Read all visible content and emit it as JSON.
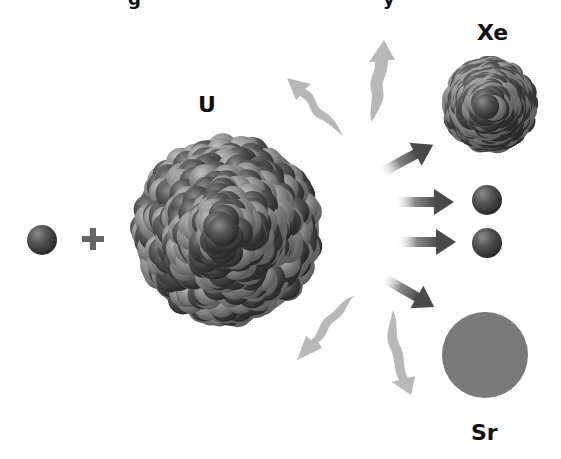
{
  "diagram": {
    "title_fragment_visible": "g … y",
    "labels": {
      "uranium": "U",
      "xenon": "Xe",
      "strontium": "Sr",
      "plus": "+"
    },
    "elements": [
      {
        "id": "incoming-neutron",
        "kind": "neutron",
        "label": ""
      },
      {
        "id": "plus-sign",
        "kind": "operator",
        "label": "+"
      },
      {
        "id": "uranium-nucleus",
        "kind": "nucleus",
        "label": "U"
      },
      {
        "id": "xenon-nucleus",
        "kind": "nucleus",
        "label": "Xe"
      },
      {
        "id": "released-neutron-1",
        "kind": "neutron",
        "label": ""
      },
      {
        "id": "released-neutron-2",
        "kind": "neutron",
        "label": ""
      },
      {
        "id": "strontium-nucleus",
        "kind": "nucleus",
        "label": "Sr"
      }
    ],
    "arrows": [
      {
        "id": "arrow-to-xe",
        "style": "straight",
        "direction": "up-right"
      },
      {
        "id": "arrow-to-neutron-1",
        "style": "straight",
        "direction": "right"
      },
      {
        "id": "arrow-to-neutron-2",
        "style": "straight",
        "direction": "right"
      },
      {
        "id": "arrow-to-sr",
        "style": "straight",
        "direction": "down-right"
      },
      {
        "id": "energy-wave-up-left",
        "style": "wavy",
        "direction": "up-left"
      },
      {
        "id": "energy-wave-up",
        "style": "wavy",
        "direction": "up"
      },
      {
        "id": "energy-wave-down-left",
        "style": "wavy",
        "direction": "down-left"
      },
      {
        "id": "energy-wave-down",
        "style": "wavy",
        "direction": "down"
      }
    ],
    "colors": {
      "proton_dark": "#4a4a4a",
      "neutron_light": "#8a8a8a",
      "arrow_dark": "#555555",
      "wave_light": "#b5b5b5",
      "text": "#111111"
    }
  }
}
